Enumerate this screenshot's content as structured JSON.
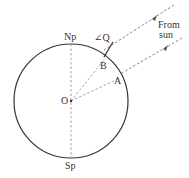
{
  "diagram": {
    "labels": {
      "north_pole": "Np",
      "south_pole": "Sp",
      "center": "O",
      "point_b": "B",
      "point_a": "A",
      "angle_q": "∠Q",
      "from_sun_line1": "From",
      "from_sun_line2": "sun"
    },
    "colors": {
      "circle": "#333333",
      "dashed": "#9a9a9a",
      "text": "#333333"
    }
  }
}
